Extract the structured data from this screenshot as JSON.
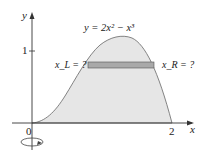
{
  "diagram": {
    "equation": "y = 2x² − x³",
    "axis_x_label": "x",
    "axis_y_label": "y",
    "origin_label": "0",
    "x_tick_label": "2",
    "y_tick_label": "1",
    "left_label": "x_L = ?",
    "right_label": "x_R = ?",
    "colors": {
      "region_fill": "#e6e6e6",
      "strip_fill": "#a9a9a9",
      "curve": "#666666",
      "axes": "#333333"
    }
  }
}
